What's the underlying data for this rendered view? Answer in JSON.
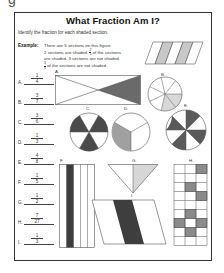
{
  "page_fragment": "g",
  "worksheet": {
    "title": "What Fraction Am I?",
    "instructions": "Identify the fraction for each shaded section.",
    "example": {
      "label": "Example:",
      "lines": [
        "There are 5 sections on this figure.",
        "2 sections are shaded.",
        "of the sections",
        "are shaded. 3 sections are not shaded.",
        "of the sections are not shaded."
      ],
      "fraction_shaded": {
        "num": "2",
        "den": "5"
      },
      "fraction_not_shaded": {
        "num": "3",
        "den": "5"
      }
    },
    "answers": [
      {
        "letter": "A.",
        "num": "1",
        "den": "4"
      },
      {
        "letter": "B.",
        "num": "3",
        "den": "7"
      },
      {
        "letter": "C.",
        "num": "3",
        "den": "6"
      },
      {
        "letter": "D.",
        "num": "1",
        "den": "3"
      },
      {
        "letter": "E.",
        "num": "4",
        "den": "8"
      },
      {
        "letter": "F.",
        "num": "1",
        "den": "5"
      },
      {
        "letter": "G.",
        "num": "1",
        "den": "2"
      },
      {
        "letter": "H.",
        "num": "7",
        "den": "27"
      },
      {
        "letter": "I.",
        "num": "1",
        "den": "3"
      }
    ],
    "figure_labels": {
      "A": "A.",
      "B": "B.",
      "C": "C.",
      "D": "D.",
      "E": "E.",
      "F": "F.",
      "G": "G.",
      "H": "H.",
      "I": "I."
    }
  },
  "colors": {
    "dark_shade": "#4a4a4a",
    "medium_shade": "#9a9a9a",
    "light_shade": "#d4d4d4",
    "outline": "#555555"
  }
}
